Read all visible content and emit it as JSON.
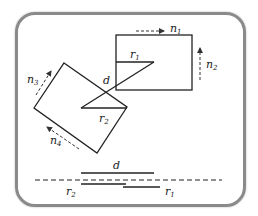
{
  "diagram": {
    "frame_color": "#8a8a8a",
    "line_color": "#222222",
    "labels": {
      "n1": {
        "base": "n",
        "sub": "1"
      },
      "n2": {
        "base": "n",
        "sub": "2"
      },
      "n3": {
        "base": "n",
        "sub": "3"
      },
      "n4": {
        "base": "n",
        "sub": "4"
      },
      "r1_top": {
        "base": "r",
        "sub": "1"
      },
      "r2_mid": {
        "base": "r",
        "sub": "2"
      },
      "d_mid": {
        "base": "d"
      },
      "d_bottom": {
        "base": "d"
      },
      "r2_bottom": {
        "base": "r",
        "sub": "2"
      },
      "r1_bottom": {
        "base": "r",
        "sub": "1"
      }
    },
    "shapes": {
      "upright_rectangle": {
        "x": 116,
        "y": 35,
        "width": 76,
        "height": 55
      },
      "tilted_rectangle": {
        "points": [
          [
            64,
            63
          ],
          [
            127,
            107
          ],
          [
            97,
            153
          ],
          [
            34,
            108
          ]
        ]
      },
      "r1_segment": [
        [
          116,
          62
        ],
        [
          154,
          62
        ]
      ],
      "d_segment": [
        [
          154,
          62
        ],
        [
          81,
          108
        ]
      ],
      "r2_segment": [
        [
          81,
          108
        ],
        [
          127,
          108
        ]
      ]
    },
    "projection": {
      "axis": {
        "y": 180,
        "x1": 35,
        "x2": 222
      },
      "d_line": {
        "y": 173,
        "x1": 81,
        "x2": 154
      },
      "r2_line": {
        "y": 184,
        "x1": 81,
        "x2": 126
      },
      "r1_line": {
        "y": 187,
        "x1": 123,
        "x2": 160
      }
    }
  }
}
